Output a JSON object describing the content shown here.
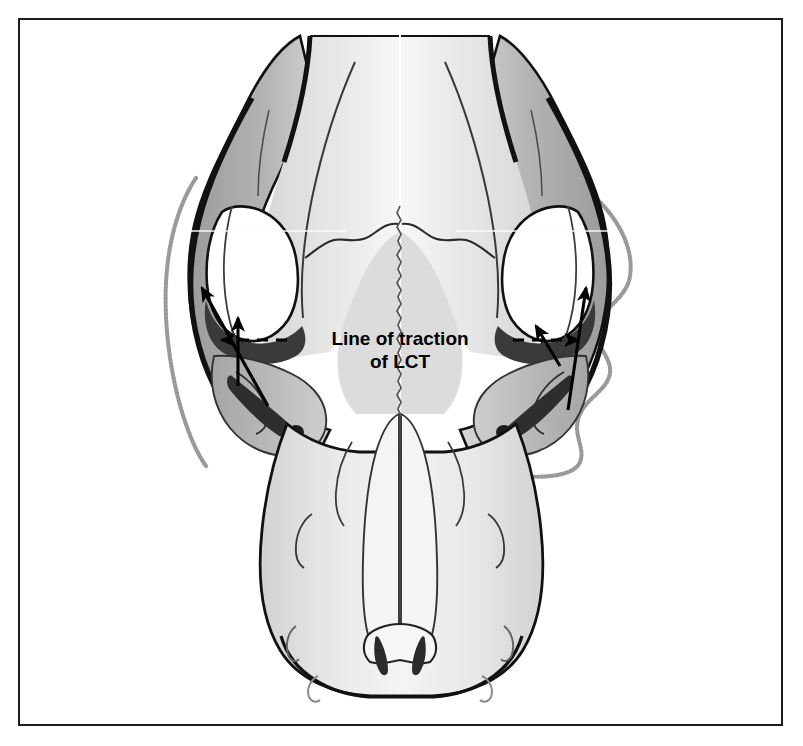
{
  "figure": {
    "domain": "anatomical-illustration",
    "frame": {
      "border_color": "#1c1c1c",
      "background": "#ffffff"
    }
  },
  "annotations": {
    "traction_label": {
      "line1": "Line of traction",
      "line2": "of LCT",
      "abbreviation_expansion_shown": false
    }
  },
  "palette": {
    "outline": "#111111",
    "mid_gray": "#a9a9a9",
    "light_gray": "#e4e4e4",
    "pale_gray": "#f1f1f1",
    "dark_wedge": "#3a3a3a",
    "soft_tissue_line": "#8c8c8c",
    "white": "#ffffff"
  },
  "structures": [
    {
      "name": "cranium-left-lateral",
      "shading": "mid_gray"
    },
    {
      "name": "cranium-right-lateral",
      "shading": "mid_gray"
    },
    {
      "name": "sagittal-midline-suture",
      "shading": "outline"
    },
    {
      "name": "orbit-left",
      "shading": "white"
    },
    {
      "name": "orbit-right",
      "shading": "white"
    },
    {
      "name": "temporal-fossa-left",
      "shading": "dark_wedge"
    },
    {
      "name": "temporal-fossa-right",
      "shading": "dark_wedge"
    },
    {
      "name": "zygomatic-arch-left",
      "shading": "mid_gray"
    },
    {
      "name": "zygomatic-arch-right",
      "shading": "mid_gray"
    },
    {
      "name": "rostrum",
      "shading": "pale_gray"
    },
    {
      "name": "nasal-bones",
      "shading": "pale_gray"
    },
    {
      "name": "incisor-row",
      "shading": "outline"
    },
    {
      "name": "canine-left",
      "shading": "dark_wedge"
    },
    {
      "name": "canine-right",
      "shading": "dark_wedge"
    },
    {
      "name": "soft-tissue-outline-left",
      "shading": "soft_tissue_line"
    },
    {
      "name": "soft-tissue-outline-right",
      "shading": "soft_tissue_line"
    }
  ],
  "arrows": [
    {
      "name": "traction-arrow-left-vertical",
      "direction": "up"
    },
    {
      "name": "traction-arrow-left-oblique",
      "direction": "up-left"
    },
    {
      "name": "traction-arrow-right-vertical",
      "direction": "up-left"
    },
    {
      "name": "traction-arrow-right-oblique",
      "direction": "up-right"
    },
    {
      "name": "traction-dashed-line-left",
      "direction": "left"
    },
    {
      "name": "traction-dashed-line-right",
      "direction": "right"
    }
  ]
}
